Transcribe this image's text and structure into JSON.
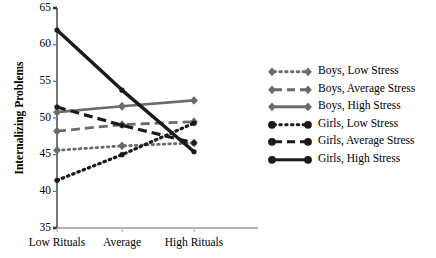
{
  "chart_data": {
    "type": "line",
    "title": "",
    "xlabel": "",
    "ylabel": "Internalizing Problems",
    "categories": [
      "Low Rituals",
      "Average",
      "High Rituals"
    ],
    "ylim": [
      35,
      65
    ],
    "yticks": [
      35,
      40,
      45,
      50,
      55,
      60,
      65
    ],
    "grid": false,
    "legend_position": "right",
    "series": [
      {
        "name": "Boys, Low Stress",
        "values": [
          45.6,
          46.2,
          46.6
        ],
        "color": "#6b6b6b",
        "dash": "dotted",
        "marker": "diamond"
      },
      {
        "name": "Boys, Average Stress",
        "values": [
          48.2,
          49.1,
          49.5
        ],
        "color": "#6b6b6b",
        "dash": "dashed",
        "marker": "diamond"
      },
      {
        "name": "Boys, High Stress",
        "values": [
          50.8,
          51.6,
          52.4
        ],
        "color": "#6b6b6b",
        "dash": "solid",
        "marker": "diamond"
      },
      {
        "name": "Girls, Low Stress",
        "values": [
          41.5,
          45.0,
          49.3
        ],
        "color": "#1a1a1a",
        "dash": "dotted",
        "marker": "circle"
      },
      {
        "name": "Girls, Average Stress",
        "values": [
          51.5,
          49.0,
          46.6
        ],
        "color": "#1a1a1a",
        "dash": "dashed",
        "marker": "circle"
      },
      {
        "name": "Girls, High Stress",
        "values": [
          62.0,
          53.8,
          45.4
        ],
        "color": "#1a1a1a",
        "dash": "solid",
        "marker": "circle"
      }
    ]
  },
  "axes": {
    "y_tick_labels": [
      "65",
      "60",
      "55",
      "50",
      "45",
      "40",
      "35"
    ],
    "y_axis_title": "Internalizing Problems",
    "x_tick_labels": [
      "Low Rituals",
      "Average",
      "High Rituals"
    ]
  },
  "legend": {
    "entries": [
      {
        "label": "Boys, Low Stress"
      },
      {
        "label": "Boys, Average Stress"
      },
      {
        "label": "Boys, High Stress"
      },
      {
        "label": "Girls, Low Stress"
      },
      {
        "label": "Girls, Average Stress"
      },
      {
        "label": "Girls, High Stress"
      }
    ]
  },
  "cropped_header": {
    "text": ""
  }
}
